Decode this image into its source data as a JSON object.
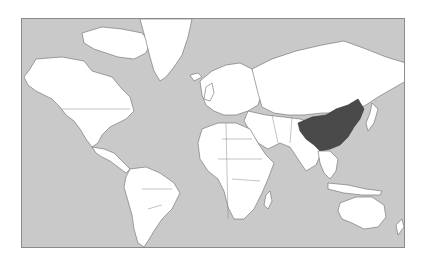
{
  "map": {
    "type": "world-choropleth",
    "projection": "mercator",
    "colors": {
      "ocean": "#c9c9c9",
      "land": "#ffffff",
      "highlight": "#4a4a4a",
      "frame_border": "#8a8a8a",
      "country_border": "#6a6a6a"
    },
    "highlighted_regions": [
      {
        "name": "China",
        "color": "#4a4a4a"
      }
    ]
  }
}
